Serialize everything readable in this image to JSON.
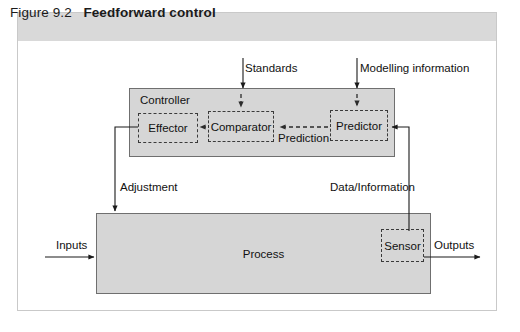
{
  "figure": {
    "caption_label": "Figure 9.2",
    "caption_title": "Feedforward control",
    "frame_color": "#c9c9c9",
    "caption_band_color": "#d9d9d9"
  },
  "diagram": {
    "type": "block-diagram",
    "fill_color": "#d6d6d6",
    "stroke_color": "#6f6f6f",
    "dashed_stroke_color": "#3a3a3a",
    "blocks": [
      {
        "id": "controller",
        "label": "Controller",
        "style": "solid"
      },
      {
        "id": "process",
        "label": "Process",
        "style": "solid"
      },
      {
        "id": "effector",
        "label": "Effector",
        "style": "dashed"
      },
      {
        "id": "comparator",
        "label": "Comparator",
        "style": "dashed"
      },
      {
        "id": "predictor",
        "label": "Predictor",
        "style": "dashed"
      },
      {
        "id": "sensor",
        "label": "Sensor",
        "style": "dashed"
      }
    ],
    "flow_labels": {
      "standards": "Standards",
      "modelling_information": "Modelling information",
      "prediction": "Prediction",
      "adjustment": "Adjustment",
      "data_information": "Data/Information",
      "inputs": "Inputs",
      "outputs": "Outputs"
    }
  }
}
